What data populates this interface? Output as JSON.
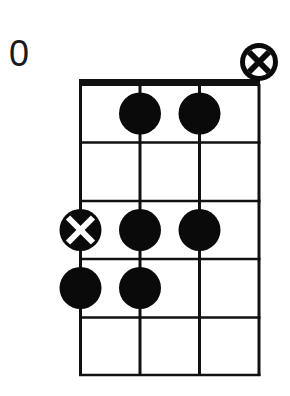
{
  "chord_diagram": {
    "fret_label": "0",
    "strings": 4,
    "frets": 5,
    "colors": {
      "line": "#111111",
      "dot": "#0a0a0a",
      "background": "#ffffff"
    },
    "open_string_markers": [
      {
        "string": 4,
        "type": "muted-circle-x"
      }
    ],
    "dots": [
      {
        "string": 2,
        "fret": 1,
        "type": "filled"
      },
      {
        "string": 3,
        "fret": 1,
        "type": "filled"
      },
      {
        "string": 1,
        "fret": 3,
        "type": "root-x"
      },
      {
        "string": 2,
        "fret": 3,
        "type": "filled"
      },
      {
        "string": 3,
        "fret": 3,
        "type": "filled"
      },
      {
        "string": 1,
        "fret": 4,
        "type": "filled"
      },
      {
        "string": 2,
        "fret": 4,
        "type": "filled"
      }
    ]
  }
}
